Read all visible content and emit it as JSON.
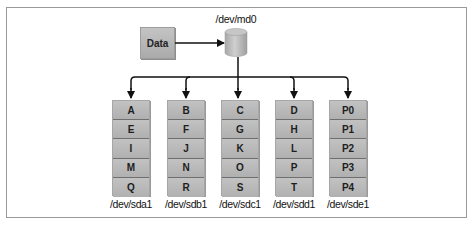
{
  "diagram": {
    "type": "RAID-5 striping with parity",
    "source": {
      "label": "Data"
    },
    "array": {
      "label": "/dev/md0"
    },
    "disks": [
      {
        "label": "/dev/sda1",
        "blocks": [
          "A",
          "E",
          "I",
          "M",
          "Q"
        ]
      },
      {
        "label": "/dev/sdb1",
        "blocks": [
          "B",
          "F",
          "J",
          "N",
          "R"
        ]
      },
      {
        "label": "/dev/sdc1",
        "blocks": [
          "C",
          "G",
          "K",
          "O",
          "S"
        ]
      },
      {
        "label": "/dev/sdd1",
        "blocks": [
          "D",
          "H",
          "L",
          "P",
          "T"
        ]
      },
      {
        "label": "/dev/sde1",
        "blocks": [
          "P0",
          "P1",
          "P2",
          "P3",
          "P4"
        ]
      }
    ],
    "colors": {
      "box_fill": "#b8b8b8",
      "line": "#111111",
      "frame": "#9a9a9a"
    }
  }
}
